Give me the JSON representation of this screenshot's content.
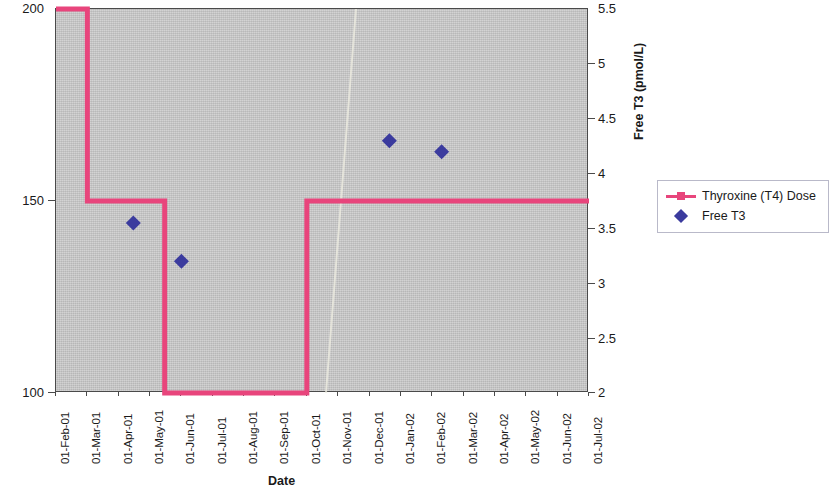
{
  "chart_data": {
    "type": "line",
    "title": "",
    "xlabel": "Date",
    "ylabel_left": "Thyroxine (T4) Dose (mcg)",
    "ylabel_right": "Free T3 (pmol/L)",
    "grid": false,
    "legend_position": "right",
    "x_categories": [
      "01-Feb-01",
      "01-Mar-01",
      "01-Apr-01",
      "01-May-01",
      "01-Jun-01",
      "01-Jul-01",
      "01-Aug-01",
      "01-Sep-01",
      "01-Oct-01",
      "01-Nov-01",
      "01-Dec-01",
      "01-Jan-02",
      "01-Feb-02",
      "01-Mar-02",
      "01-Apr-02",
      "01-May-02",
      "01-Jun-02",
      "01-Jul-02"
    ],
    "y_left_ticks": [
      "100",
      "150",
      "200"
    ],
    "y_left_values": [
      100,
      150,
      200
    ],
    "y_left_lim": [
      100,
      200
    ],
    "y_right_ticks": [
      "2",
      "2.5",
      "3",
      "3.5",
      "4",
      "4.5",
      "5",
      "5.5"
    ],
    "y_right_values": [
      2,
      2.5,
      3,
      3.5,
      4,
      4.5,
      5,
      5.5
    ],
    "y_right_lim": [
      2,
      5.5
    ],
    "series": [
      {
        "name": "Thyroxine (T4) Dose",
        "type": "step",
        "axis": "left",
        "color": "#e8457c",
        "marker": "square",
        "points": [
          {
            "x": "01-Feb-01",
            "y": 200
          },
          {
            "x": "01-Mar-01",
            "y": 200
          },
          {
            "x": "01-Mar-01",
            "y": 150
          },
          {
            "x": "15-May-01",
            "y": 150
          },
          {
            "x": "15-May-01",
            "y": 100
          },
          {
            "x": "01-Oct-01",
            "y": 100
          },
          {
            "x": "01-Oct-01",
            "y": 150
          },
          {
            "x": "01-Jul-02",
            "y": 150
          }
        ]
      },
      {
        "name": "Free T3",
        "type": "scatter",
        "axis": "right",
        "color": "#3b3b9e",
        "marker": "diamond",
        "points": [
          {
            "x": "15-Apr-01",
            "y": 3.55
          },
          {
            "x": "01-Jun-01",
            "y": 3.2
          },
          {
            "x": "20-Dec-01",
            "y": 4.3
          },
          {
            "x": "10-Feb-02",
            "y": 4.2
          }
        ]
      }
    ]
  },
  "legend": {
    "items": [
      {
        "label": "Thyroxine (T4) Dose",
        "marker": "line-square",
        "color": "#e8457c"
      },
      {
        "label": "Free T3",
        "marker": "diamond",
        "color": "#3b3b9e"
      }
    ]
  },
  "colors": {
    "t4_pink": "#e8457c",
    "t3_blue": "#3b3b9e",
    "plot_background": "#c8c8c8",
    "axis": "#4a4a4a"
  }
}
